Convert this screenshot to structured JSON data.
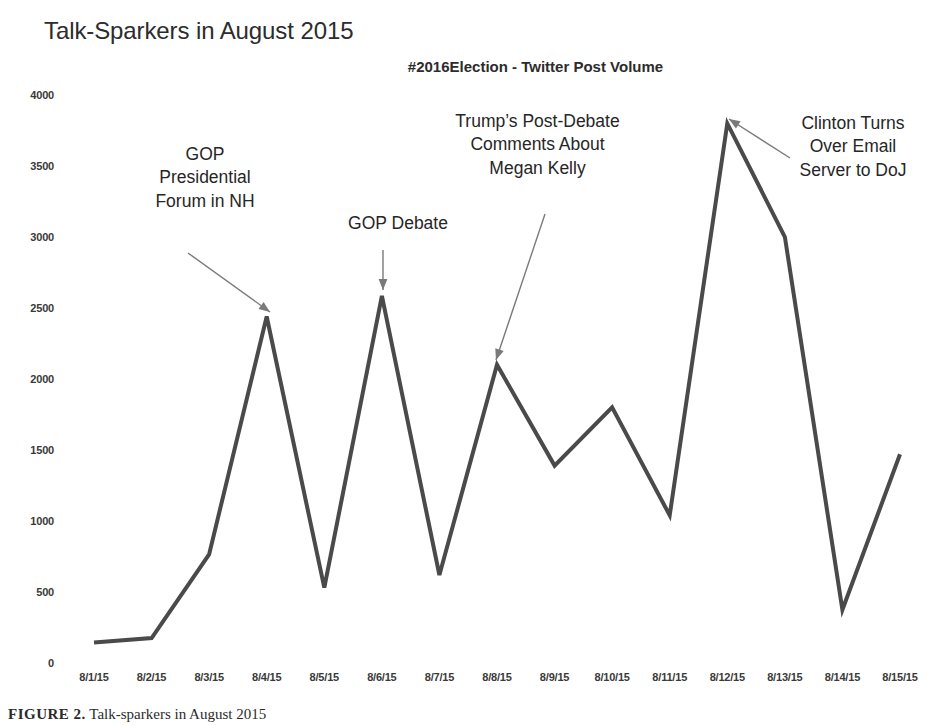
{
  "chart_data": {
    "type": "line",
    "title": "Talk-Sparkers in August 2015",
    "subtitle": "#2016Election - Twitter Post Volume",
    "xlabel": "",
    "ylabel": "",
    "ylim": [
      0,
      4000
    ],
    "ytick_values": [
      0,
      500,
      1000,
      1500,
      2000,
      2500,
      3000,
      3500,
      4000
    ],
    "ytick_labels": [
      "0",
      "500",
      "1000",
      "1500",
      "2000",
      "2500",
      "3000",
      "3500",
      "4000"
    ],
    "grid": false,
    "legend": "none",
    "line_color": "#4a4a4a",
    "line_width": 4,
    "categories": [
      "8/1/15",
      "8/2/15",
      "8/3/15",
      "8/4/15",
      "8/5/15",
      "8/6/15",
      "8/7/15",
      "8/8/15",
      "8/9/15",
      "8/10/15",
      "8/11/15",
      "8/12/15",
      "8/13/15",
      "8/14/15",
      "8/15/15"
    ],
    "values": [
      145,
      175,
      765,
      2440,
      530,
      2585,
      620,
      2100,
      1390,
      1800,
      1040,
      3800,
      3000,
      375,
      1470
    ],
    "annotations": [
      {
        "id": "gop-forum-nh",
        "lines": [
          "GOP",
          "Presidential",
          "Forum in NH"
        ],
        "points_to_category": "8/4/15",
        "points_to_value": 2440
      },
      {
        "id": "gop-debate",
        "lines": [
          "GOP Debate"
        ],
        "points_to_category": "8/6/15",
        "points_to_value": 2585
      },
      {
        "id": "trump-megan-kelly",
        "lines": [
          "Trump’s Post-Debate",
          "Comments About",
          "Megan Kelly"
        ],
        "points_to_category": "8/8/15",
        "points_to_value": 2100
      },
      {
        "id": "clinton-email-server",
        "lines": [
          "Clinton Turns",
          "Over Email",
          "Server to DoJ"
        ],
        "points_to_category": "8/12/15",
        "points_to_value": 3800
      }
    ]
  },
  "caption": {
    "figure_number": "FIGURE 2.",
    "text": "Talk-sparkers in August 2015"
  }
}
